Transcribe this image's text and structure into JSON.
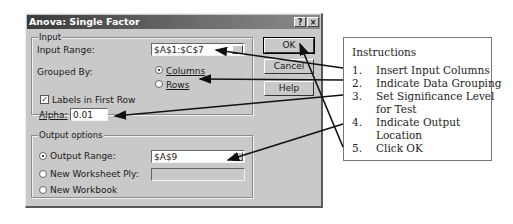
{
  "dialog": {
    "title": "Anova: Single Factor",
    "help_glyph": "?",
    "close_glyph": "×",
    "input_group": {
      "label": "Input",
      "input_range_label": "Input Range:",
      "input_range_value": "$A$1:$C$7",
      "grouped_by_label": "Grouped By:",
      "columns_label": "Columns",
      "rows_label": "Rows",
      "columns_selected": true,
      "labels_checkbox_label": "Labels in First Row",
      "labels_checked": true,
      "alpha_label": "Alpha:",
      "alpha_value": "0.01"
    },
    "output_group": {
      "label": "Output options",
      "output_range_label": "Output Range:",
      "output_range_value": "$A$9",
      "new_worksheet_label": "New Worksheet Ply:",
      "new_worksheet_value": "",
      "new_workbook_label": "New Workbook",
      "selected": "output_range"
    },
    "buttons": {
      "ok": "OK",
      "cancel": "Cancel",
      "help": "Help"
    }
  },
  "instructions": {
    "title": "Instructions",
    "steps": [
      {
        "num": "1.",
        "line1": "Insert Input Columns",
        "line2": ""
      },
      {
        "num": "2.",
        "line1": "Indicate Data Grouping",
        "line2": ""
      },
      {
        "num": "3.",
        "line1": "Set Significance Level",
        "line2": "for Test"
      },
      {
        "num": "4.",
        "line1": "Indicate Output",
        "line2": "Location"
      },
      {
        "num": "5.",
        "line1": "Click OK",
        "line2": ""
      }
    ]
  },
  "colors": {
    "dialog_bg": "#c9c9c9",
    "title_bar": "#3a3a3a",
    "arrow": "#111111"
  }
}
